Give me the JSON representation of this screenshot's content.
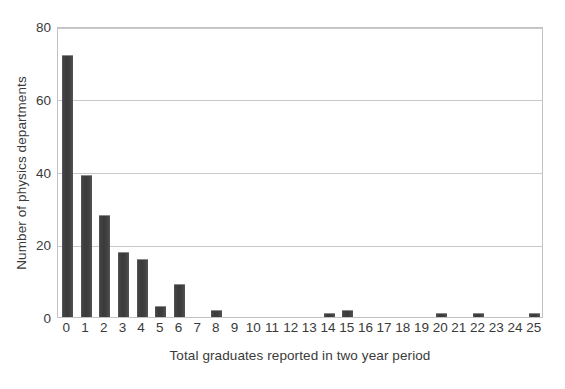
{
  "chart_data": {
    "type": "bar",
    "title": "",
    "subtitle": "",
    "xlabel": "Total graduates reported in two year period",
    "ylabel": "Number of physics departments",
    "categories": [
      "0",
      "1",
      "2",
      "3",
      "4",
      "5",
      "6",
      "7",
      "8",
      "9",
      "10",
      "11",
      "12",
      "13",
      "14",
      "15",
      "16",
      "17",
      "18",
      "19",
      "20",
      "21",
      "22",
      "23",
      "24",
      "25"
    ],
    "values": [
      72,
      39,
      28,
      18,
      16,
      3,
      9,
      0,
      2,
      0,
      0,
      0,
      0,
      0,
      1,
      2,
      0,
      0,
      0,
      0,
      1,
      0,
      1,
      0,
      0,
      1
    ],
    "ylim": [
      0,
      80
    ],
    "ytick_labels": [
      "0",
      "20",
      "40",
      "60",
      "80"
    ],
    "ytick_values": [
      0,
      20,
      40,
      60,
      80
    ],
    "grid": true,
    "legend": false,
    "legend_position": "none",
    "bar_color": "#3f3f3f",
    "gridline_color": "#c9c9c9",
    "plot_border_color": "#c2c2c2",
    "background_color": "#ffffff",
    "text_color": "#3a3a3a"
  }
}
